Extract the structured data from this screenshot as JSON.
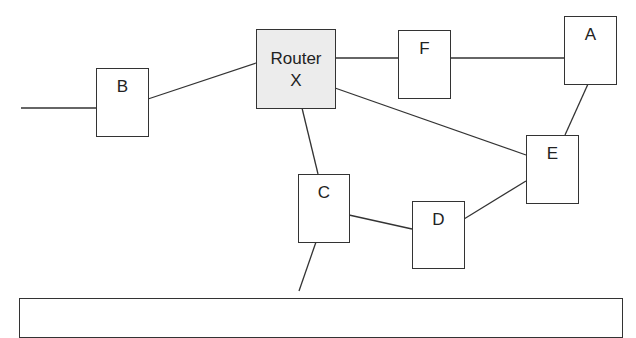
{
  "diagram": {
    "colors": {
      "stroke": "#333333",
      "router_fill": "#ececec",
      "node_fill": "#ffffff"
    },
    "nodes": {
      "router": {
        "label": "Router\nX"
      },
      "B": {
        "label": "B"
      },
      "F": {
        "label": "F"
      },
      "A": {
        "label": "A"
      },
      "C": {
        "label": "C"
      },
      "D": {
        "label": "D"
      },
      "E": {
        "label": "E"
      }
    },
    "edges": [
      [
        "external-left",
        "B"
      ],
      [
        "B",
        "Router X"
      ],
      [
        "Router X",
        "F"
      ],
      [
        "F",
        "A"
      ],
      [
        "Router X",
        "E"
      ],
      [
        "A",
        "E"
      ],
      [
        "Router X",
        "C"
      ],
      [
        "C",
        "D"
      ],
      [
        "D",
        "E"
      ],
      [
        "C",
        "external-bottom"
      ]
    ],
    "caption": ""
  }
}
